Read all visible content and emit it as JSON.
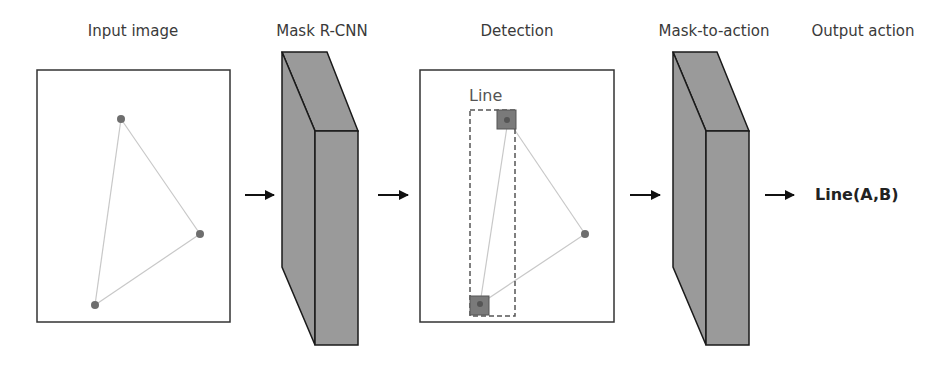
{
  "stages": [
    {
      "id": "input",
      "label": "Input image"
    },
    {
      "id": "mask_rcnn",
      "label": "Mask R-CNN"
    },
    {
      "id": "detection",
      "label": "Detection"
    },
    {
      "id": "mask_to_action",
      "label": "Mask-to-action"
    },
    {
      "id": "output",
      "label": "Output action"
    }
  ],
  "detection": {
    "box_label": "Line"
  },
  "output": {
    "action": "Line(A,B)"
  },
  "colors": {
    "block_fill": "#9a9a9a",
    "block_stroke": "#1a1a1a",
    "point_fill": "#6e6e6e",
    "edge_stroke": "#c8c8c8",
    "mask_fill": "#7a7a7a",
    "frame_stroke": "#333333"
  }
}
